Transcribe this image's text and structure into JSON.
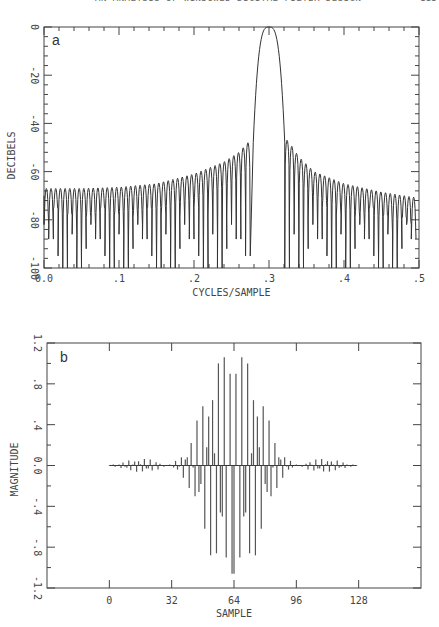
{
  "page": {
    "running_header": "AN ANALYSIS OF WINDOWED DIGITAL FILTER DESIGN",
    "page_number": "111"
  },
  "chart_data": [
    {
      "id": "a",
      "type": "line",
      "panel_label": "a",
      "title": "",
      "xlabel": "CYCLES/SAMPLE",
      "ylabel": "DECIBELS",
      "xlim": [
        0.0,
        0.5
      ],
      "ylim": [
        -100,
        0
      ],
      "x_ticks": [
        0.0,
        0.1,
        0.2,
        0.3,
        0.4,
        0.5
      ],
      "x_tick_labels": [
        "0.0",
        ".1",
        ".2",
        ".3",
        ".4",
        ".5"
      ],
      "x_minor_step": 0.02,
      "y_ticks": [
        0,
        -20,
        -40,
        -60,
        -80,
        -100
      ],
      "y_tick_labels": [
        "0",
        "-20",
        "-40",
        "-60",
        "-80",
        "-100"
      ],
      "y_minor_step": 4,
      "grid": false,
      "description": "Magnitude response of bandpass filter; passband centered at 0.3 cycles/sample, sidelobes ~-67 dB near 0 rising to ~-47 dB adjacent to main lobe, ~-72 dB near 0.5",
      "main_lobe": {
        "center": 0.3,
        "edges": [
          0.279,
          0.321
        ],
        "peak_db": 0,
        "edge_db": -48
      },
      "sidelobe_spacing": 0.00625,
      "sidelobe_envelope_left": [
        [
          0.0,
          -67
        ],
        [
          0.05,
          -67
        ],
        [
          0.1,
          -66.5
        ],
        [
          0.15,
          -65
        ],
        [
          0.2,
          -61
        ],
        [
          0.24,
          -56
        ],
        [
          0.26,
          -52
        ],
        [
          0.275,
          -47
        ]
      ],
      "sidelobe_envelope_right": [
        [
          0.325,
          -47
        ],
        [
          0.34,
          -54
        ],
        [
          0.36,
          -60
        ],
        [
          0.4,
          -65
        ],
        [
          0.45,
          -68.5
        ],
        [
          0.5,
          -71
        ]
      ],
      "null_depths_cycle": [
        -82,
        -88,
        -75,
        -95,
        -100,
        -78,
        -86,
        -100,
        -92,
        -79
      ]
    },
    {
      "id": "b",
      "type": "bar",
      "subtype": "stem",
      "panel_label": "b",
      "title": "",
      "xlabel": "SAMPLE",
      "ylabel": "MAGNITUDE",
      "xlim": [
        -32,
        160
      ],
      "ylim": [
        -1.2,
        1.2
      ],
      "x_ticks": [
        0,
        32,
        64,
        96,
        128
      ],
      "x_tick_labels": [
        "0",
        "32",
        "64",
        "96",
        "128"
      ],
      "y_ticks": [
        1.2,
        0.8,
        0.4,
        0.0,
        -0.4,
        -0.8,
        -1.2
      ],
      "y_tick_labels": [
        "1.2",
        ".8",
        ".4",
        "0.0",
        "-.4",
        "-.8",
        "-1.2"
      ],
      "y_minor_step": 0.2,
      "grid": false,
      "x": "n = 0..127",
      "values": [
        0.004,
        -0.006,
        0.01,
        -0.012,
        0.006,
        0.01,
        -0.025,
        0.03,
        -0.012,
        -0.022,
        0.048,
        -0.046,
        0.01,
        0.038,
        -0.06,
        0.042,
        0.012,
        -0.058,
        0.064,
        -0.03,
        -0.03,
        0.06,
        -0.05,
        0.008,
        0.032,
        -0.04,
        0.018,
        0.006,
        -0.012,
        0.004,
        -0.002,
        0.01,
        -0.006,
        -0.02,
        0.045,
        -0.04,
        -0.01,
        0.08,
        -0.12,
        0.06,
        0.08,
        -0.22,
        0.22,
        -0.02,
        -0.3,
        0.44,
        -0.26,
        -0.18,
        0.58,
        -0.62,
        0.18,
        0.48,
        -0.88,
        0.64,
        0.12,
        -0.86,
        1.0,
        -0.46,
        -0.5,
        1.06,
        -0.9,
        0.0,
        0.9,
        -1.06,
        -1.06,
        0.9,
        0.0,
        -0.9,
        1.06,
        -0.5,
        -0.46,
        1.0,
        -0.86,
        0.12,
        0.64,
        -0.88,
        0.48,
        0.18,
        -0.62,
        0.58,
        -0.18,
        -0.26,
        0.44,
        -0.3,
        -0.02,
        0.22,
        -0.22,
        0.08,
        0.06,
        -0.12,
        0.08,
        -0.01,
        -0.04,
        0.045,
        -0.02,
        -0.006,
        0.01,
        -0.002,
        0.004,
        -0.012,
        0.006,
        0.018,
        -0.04,
        0.032,
        0.008,
        -0.05,
        0.06,
        -0.03,
        -0.03,
        0.064,
        -0.058,
        0.012,
        0.042,
        -0.06,
        0.038,
        0.01,
        -0.046,
        0.048,
        -0.022,
        -0.012,
        0.03,
        -0.025,
        0.01,
        0.006,
        -0.012,
        0.01,
        -0.006,
        0.004
      ]
    }
  ]
}
